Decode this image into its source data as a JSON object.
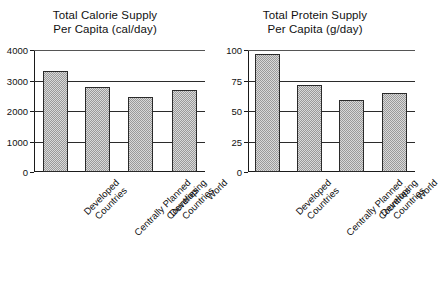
{
  "figure": {
    "name": "food-supply-per-capita-bar-charts",
    "background": "#ffffff",
    "bar_fill": "#d9d9d9",
    "bar_edge": "#2a2a2a",
    "grid_color": "#2b2b2b"
  },
  "panels": [
    {
      "id": "calorie",
      "title_line1": "Total Calorie Supply",
      "title_line2": "Per Capita (cal/day)"
    },
    {
      "id": "protein",
      "title_line1": "Total Protein Supply",
      "title_line2": "Per Capita (g/day)"
    }
  ],
  "categories": [
    {
      "line1": "Developed",
      "line2": "Countries"
    },
    {
      "line1": "Centrally Planned",
      "line2": "Countries"
    },
    {
      "line1": "Developing",
      "line2": "Countries"
    },
    {
      "line1": "World",
      "line2": ""
    }
  ],
  "chart_data": [
    {
      "type": "bar",
      "id": "calorie",
      "title": "Total Calorie Supply Per Capita (cal/day)",
      "xlabel": "",
      "ylabel": "",
      "categories": [
        "Developed Countries",
        "Centrally Planned Countries",
        "Developing Countries",
        "World"
      ],
      "values": [
        3300,
        2800,
        2450,
        2700
      ],
      "ylim": [
        0,
        4000
      ],
      "yticks": [
        0,
        1000,
        2000,
        3000,
        4000
      ],
      "ytick_labels": [
        "0",
        "1000",
        "2000",
        "3000",
        "4000"
      ],
      "grid": true,
      "legend": "none"
    },
    {
      "type": "bar",
      "id": "protein",
      "title": "Total Protein Supply Per Capita (g/day)",
      "xlabel": "",
      "ylabel": "",
      "categories": [
        "Developed Countries",
        "Centrally Planned Countries",
        "Developing Countries",
        "World"
      ],
      "values": [
        97,
        71,
        59,
        65
      ],
      "ylim": [
        0,
        100
      ],
      "yticks": [
        0,
        25,
        50,
        75,
        100
      ],
      "ytick_labels": [
        "0",
        "25",
        "50",
        "75",
        "100"
      ],
      "grid": true,
      "legend": "none"
    }
  ]
}
